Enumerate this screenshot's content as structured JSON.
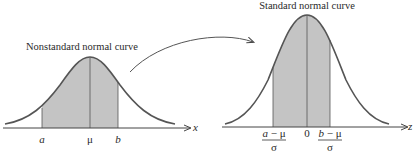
{
  "left_panel": {
    "title": "Nonstandard normal curve",
    "axis_label": "x",
    "tick_labels": {
      "a": "a",
      "mu": "μ",
      "b": "b"
    }
  },
  "right_panel": {
    "title": "Standard normal curve",
    "axis_label": "z",
    "tick_labels": {
      "left_num": "a − μ",
      "left_den": "σ",
      "zero": "0",
      "right_num": "b − μ",
      "right_den": "σ"
    }
  },
  "colors": {
    "curve": "#555555",
    "shade": "#c4c4c4",
    "axis": "#444444",
    "text": "#2a2a2a"
  }
}
